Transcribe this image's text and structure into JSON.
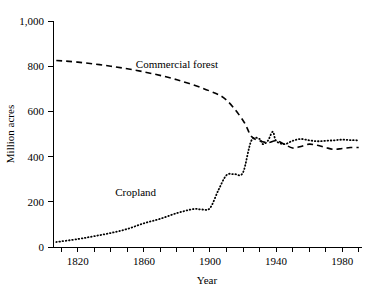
{
  "chart_data": {
    "type": "line",
    "title": "",
    "xlabel": "Year",
    "ylabel": "Million acres",
    "xlim": [
      1805,
      1992
    ],
    "ylim": [
      0,
      1000
    ],
    "grid": false,
    "legend_position": "inline-annotations",
    "xticks": [
      1810,
      1820,
      1830,
      1840,
      1850,
      1860,
      1870,
      1880,
      1890,
      1900,
      1910,
      1920,
      1930,
      1940,
      1950,
      1960,
      1970,
      1980,
      1990
    ],
    "xticklabels": [
      "",
      "1820",
      "",
      "",
      "",
      "1860",
      "",
      "",
      "",
      "1900",
      "",
      "",
      "",
      "1940",
      "",
      "",
      "",
      "1980",
      ""
    ],
    "xtick_labeled": [
      "1820",
      "1860",
      "1900",
      "1940",
      "1980"
    ],
    "yticks": [
      0,
      200,
      400,
      600,
      800,
      1000
    ],
    "yticklabels": [
      "0",
      "200",
      "400",
      "600",
      "800",
      "1,000"
    ],
    "annotations": [
      {
        "text": "Commercial forest",
        "x": 1880,
        "y": 790
      },
      {
        "text": "Cropland",
        "x": 1855,
        "y": 225
      }
    ],
    "series": [
      {
        "name": "Commercial forest",
        "style": "dashed",
        "x": [
          1807,
          1820,
          1840,
          1860,
          1880,
          1900,
          1910,
          1920,
          1925,
          1930,
          1935,
          1940,
          1945,
          1950,
          1955,
          1960,
          1965,
          1970,
          1975,
          1980,
          1985,
          1990
        ],
        "values": [
          825,
          818,
          800,
          775,
          740,
          690,
          650,
          560,
          490,
          470,
          462,
          470,
          455,
          438,
          445,
          455,
          450,
          440,
          432,
          436,
          440,
          440
        ]
      },
      {
        "name": "Cropland",
        "style": "dotted",
        "x": [
          1807,
          1820,
          1830,
          1840,
          1850,
          1860,
          1870,
          1880,
          1890,
          1895,
          1900,
          1905,
          1910,
          1915,
          1920,
          1925,
          1930,
          1932,
          1935,
          1938,
          1940,
          1945,
          1950,
          1955,
          1960,
          1965,
          1970,
          1975,
          1980,
          1985,
          1990
        ],
        "values": [
          22,
          35,
          48,
          62,
          80,
          105,
          125,
          150,
          168,
          166,
          172,
          250,
          318,
          322,
          330,
          470,
          478,
          455,
          470,
          510,
          470,
          455,
          470,
          478,
          472,
          468,
          470,
          472,
          475,
          473,
          472
        ]
      }
    ]
  }
}
